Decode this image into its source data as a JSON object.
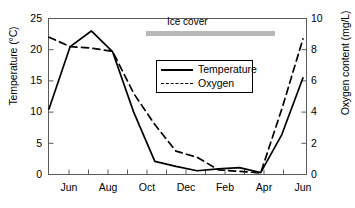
{
  "chart_data": {
    "type": "line",
    "title": "",
    "xlabel": "",
    "ylabel": "Temperature (°C)",
    "y2label": "Oxygen content (mg/L)",
    "grid": false,
    "legend_position": "upper-center",
    "x": [
      "Jun",
      "Jul",
      "Aug",
      "Sep",
      "Oct",
      "Nov",
      "Dec",
      "Jan",
      "Feb",
      "Mar",
      "Apr",
      "May",
      "Jun"
    ],
    "xticklabels": [
      "Jun",
      "Aug",
      "Oct",
      "Dec",
      "Feb",
      "Apr",
      "Jun"
    ],
    "xtick_values": [
      "Jun",
      "Aug",
      "Oct",
      "Dec",
      "Feb",
      "Apr",
      "Jun"
    ],
    "xlim": [
      "May",
      "Jun"
    ],
    "ylim": [
      0,
      25
    ],
    "yticks": [
      0,
      5,
      10,
      15,
      20,
      25
    ],
    "yticklabels": [
      "0",
      "5",
      "10",
      "15",
      "20",
      "25"
    ],
    "y2lim": [
      0,
      10
    ],
    "y2ticks": [
      0,
      2,
      4,
      6,
      8,
      10
    ],
    "y2ticklabels": [
      "0",
      "2",
      "4",
      "6",
      "8",
      "10"
    ],
    "series": [
      {
        "name": "Temperature",
        "axis": "left",
        "style": "solid",
        "unit": "°C",
        "values": [
          10.5,
          20.5,
          23.0,
          19.7,
          10.0,
          2.1,
          1.3,
          0.6,
          0.9,
          1.1,
          0.3,
          6.4,
          15.5
        ]
      },
      {
        "name": "Oxygen",
        "axis": "right",
        "style": "dashed",
        "unit": "mg/L",
        "values": [
          8.8,
          8.2,
          8.1,
          7.9,
          5.2,
          3.2,
          1.5,
          1.1,
          0.3,
          0.2,
          0.1,
          4.2,
          8.7
        ]
      }
    ],
    "annotations": [
      {
        "name": "ice-cover",
        "label": "Ice cover",
        "type": "span-bar",
        "x_start": "Nov",
        "x_end": "Apr",
        "color": "#b9b9b9"
      }
    ],
    "legend": [
      {
        "label": "Temperature",
        "style": "solid"
      },
      {
        "label": "Oxygen",
        "style": "dashed"
      }
    ]
  },
  "axes": {
    "left_title": "Temperature (°C)",
    "right_title": "Oxygen content (mg/L)",
    "left_ticks": [
      "25",
      "20",
      "15",
      "10",
      "5",
      "0"
    ],
    "right_ticks": [
      "10",
      "8",
      "6",
      "4",
      "2",
      "0"
    ],
    "x_ticks": [
      "Jun",
      "Aug",
      "Oct",
      "Dec",
      "Feb",
      "Apr",
      "Jun"
    ]
  },
  "annotation": {
    "ice_cover_label": "Ice cover"
  },
  "legend": {
    "temperature_label": "Temperature",
    "oxygen_label": "Oxygen"
  },
  "colors": {
    "line": "#000000",
    "frame": "#5a5a5a",
    "ice_bar": "#b9b9b9",
    "background": "#ffffff"
  }
}
